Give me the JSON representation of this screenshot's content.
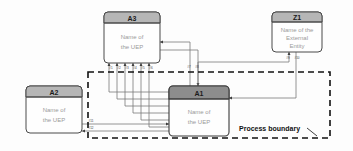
{
  "diagram": {
    "colors": {
      "header_light": "#b6b6b6",
      "header_dark": "#8d8d8d",
      "box_body": "#fefefe",
      "box_stroke": "#4a4a4a",
      "line": "#6e6e6e",
      "boundary": "#111111",
      "body_text": "#9a9a9a"
    },
    "boundary_label": "Process boundary"
  },
  "boxes": [
    {
      "id": "A3",
      "title": "A3",
      "body_line1": "Name of",
      "body_line2": "the UEP",
      "header_shade": "light"
    },
    {
      "id": "Z1",
      "title": "Z1",
      "body_line1": "Name of the",
      "body_line2": "External",
      "body_line3": "Entity",
      "header_shade": "light"
    },
    {
      "id": "A2",
      "title": "A2",
      "body_line1": "Name of",
      "body_line2": "the UEP",
      "header_shade": "light"
    },
    {
      "id": "A1",
      "title": "A1",
      "body_line1": "Name of",
      "body_line2": "the UEP",
      "header_shade": "dark"
    }
  ],
  "flow_labels": {
    "a3_bottom": [
      "#1",
      "#2",
      "#3",
      "#4",
      "#5",
      "#6"
    ],
    "a3_a1_mid": [
      "#7",
      "#8"
    ],
    "z1_bottom": [
      "#9",
      "#10"
    ],
    "a2_right": [
      "#11",
      "#12"
    ]
  }
}
